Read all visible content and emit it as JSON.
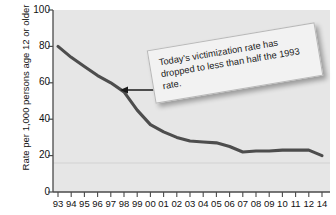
{
  "chart_data": {
    "type": "line",
    "title": "",
    "subtitle": "",
    "xlabel": "",
    "ylabel": "Rate per 1,000 persons age 12 or older",
    "ylim": [
      0,
      100
    ],
    "yticks": [
      0,
      20,
      40,
      60,
      80,
      100
    ],
    "grid": false,
    "legend_position": "none",
    "categories": [
      "93",
      "94",
      "95",
      "96",
      "97",
      "98",
      "99",
      "00",
      "01",
      "02",
      "03",
      "04",
      "05",
      "06",
      "07",
      "08",
      "09",
      "10",
      "11",
      "12",
      "14"
    ],
    "values": [
      80,
      74,
      69,
      64,
      60,
      55,
      45,
      37,
      33,
      30,
      28,
      27.5,
      27,
      25,
      22,
      22.5,
      22.5,
      23,
      23,
      23,
      20
    ],
    "series": [
      {
        "name": "Violent victimization rate",
        "color": "#4d4d4d",
        "values": [
          80,
          74,
          69,
          64,
          60,
          55,
          45,
          37,
          33,
          30,
          28,
          27.5,
          27,
          25,
          22,
          22.5,
          22.5,
          23,
          23,
          23,
          20
        ]
      }
    ],
    "annotations": [
      {
        "name": "callout",
        "text": "Today's victimization rate has dropped to less than half the 1993 rate.",
        "points_to_year": "98",
        "points_to_value": 55,
        "rotation_deg": -9.5
      }
    ]
  },
  "axes": {
    "y_tick_labels": [
      "100",
      "80",
      "60",
      "40",
      "20",
      "0"
    ],
    "y_axis_title": "Rate per 1,000 persons age 12 or older",
    "x_tick_labels": [
      "93",
      "94",
      "95",
      "96",
      "97",
      "98",
      "99",
      "00",
      "01",
      "02",
      "03",
      "04",
      "05",
      "06",
      "07",
      "08",
      "09",
      "10",
      "11",
      "12",
      "14"
    ]
  },
  "callout": {
    "text": "Today's victimization rate has dropped to less than half the 1993 rate."
  },
  "colors": {
    "line": "#4d4d4d",
    "plot_background": "#e6e6e6",
    "axis": "#4a4a4a",
    "callout_background": "#f2f2f2",
    "callout_border": "#b8b8b8",
    "text": "#111111"
  }
}
